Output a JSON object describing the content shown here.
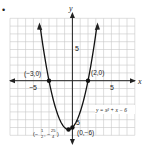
{
  "problem_marker": "•",
  "axes": {
    "x_label": "x",
    "y_label": "y",
    "x_tick_neg": "−5",
    "x_tick_pos": "5",
    "y_tick_pos": "5",
    "y_tick_neg": "5"
  },
  "points": [
    {
      "label": "(−3,0)",
      "x": -3,
      "y": 0
    },
    {
      "label": "(2,0)",
      "x": 2,
      "y": 0
    },
    {
      "label": "(0,−6)",
      "x": 0,
      "y": -6
    },
    {
      "label": "(−½, −25/4)",
      "x": -0.5,
      "y": -6.25
    }
  ],
  "vertex_label": {
    "open": "(−",
    "n1": "1",
    "d1": "2",
    "mid": ", −",
    "n2": "25",
    "d2": "4",
    "close": ")"
  },
  "equation": "y = x² + x − 6",
  "colors": {
    "grid": "#c8c8c8",
    "axis": "#222222",
    "curve": "#111111"
  },
  "chart_data": {
    "type": "line",
    "title": "",
    "function": "y = x^2 + x - 6",
    "xlabel": "x",
    "ylabel": "y",
    "xlim": [
      -8,
      8
    ],
    "ylim": [
      -7,
      8
    ],
    "grid": true,
    "x": [
      -3.5,
      -3,
      -2,
      -1,
      -0.5,
      0,
      1,
      2,
      2.5
    ],
    "y": [
      2.75,
      0,
      -4,
      -6,
      -6.25,
      -6,
      -4,
      0,
      2.75
    ],
    "marked_points": [
      [
        -3,
        0
      ],
      [
        2,
        0
      ],
      [
        0,
        -6
      ],
      [
        -0.5,
        -6.25
      ]
    ],
    "annotations": [
      "(-3,0)",
      "(2,0)",
      "(0,-6)",
      "(-1/2, -25/4)",
      "y = x^2 + x - 6"
    ]
  }
}
